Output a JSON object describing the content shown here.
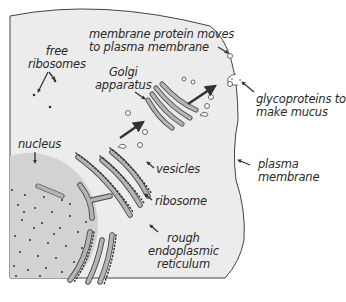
{
  "diagram": {
    "type": "cell-secretory-pathway",
    "colors": {
      "cytoplasm": "#ececec",
      "nucleus": "#d2d2d2",
      "organelle_fill": "#b4b4b4",
      "outline": "#444444",
      "arrow": "#333333",
      "text": "#2a2a2a"
    },
    "labels": {
      "free_ribosomes_1": "free",
      "free_ribosomes_2": "ribosomes",
      "membrane_protein_1": "membrane protein moves",
      "membrane_protein_2": "to plasma membrane",
      "golgi_1": "Golgi",
      "golgi_2": "apparatus",
      "glyco_1": "glycoproteins to",
      "glyco_2": "make mucus",
      "nucleus": "nucleus",
      "vesicles": "vesicles",
      "plasma_1": "plasma",
      "plasma_2": "membrane",
      "ribosome": "ribosome",
      "rer_1": "rough",
      "rer_2": "endoplasmic",
      "rer_3": "reticulum"
    }
  }
}
